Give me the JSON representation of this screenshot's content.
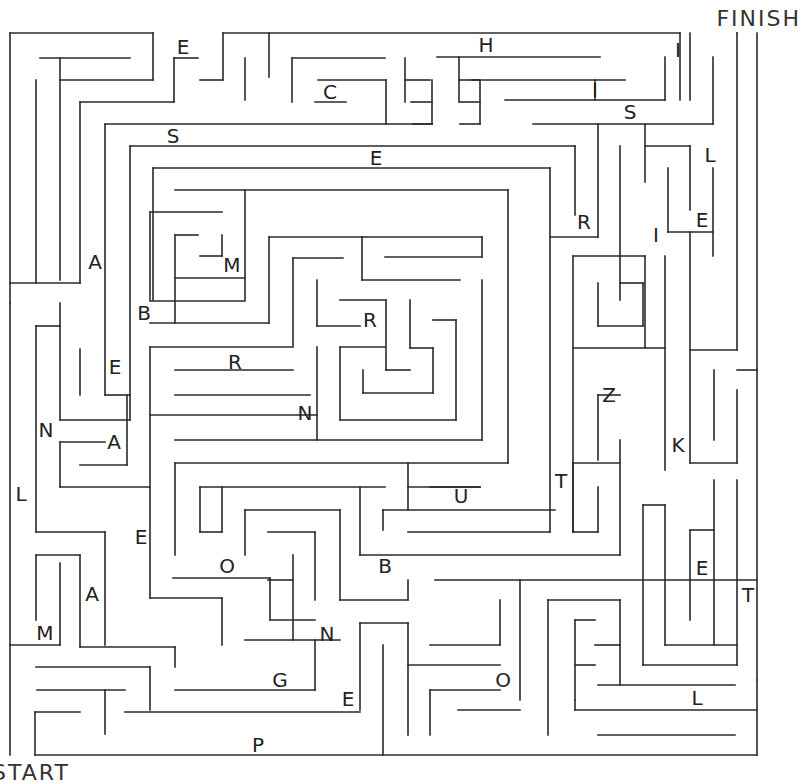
{
  "puzzle": {
    "type": "letter-maze",
    "finish_label": "FINISH",
    "start_label": "START",
    "wall_color": "#2a2a2a",
    "background": "#ffffff"
  },
  "letters": [
    {
      "ch": "E",
      "x": 183,
      "y": 47
    },
    {
      "ch": "H",
      "x": 486,
      "y": 45
    },
    {
      "ch": "I",
      "x": 678,
      "y": 50
    },
    {
      "ch": "C",
      "x": 330,
      "y": 92
    },
    {
      "ch": "I",
      "x": 595,
      "y": 90
    },
    {
      "ch": "S",
      "x": 630,
      "y": 112
    },
    {
      "ch": "S",
      "x": 173,
      "y": 136
    },
    {
      "ch": "E",
      "x": 376,
      "y": 158
    },
    {
      "ch": "L",
      "x": 710,
      "y": 155
    },
    {
      "ch": "R",
      "x": 584,
      "y": 222
    },
    {
      "ch": "E",
      "x": 702,
      "y": 220
    },
    {
      "ch": "I",
      "x": 656,
      "y": 235
    },
    {
      "ch": "A",
      "x": 95,
      "y": 262
    },
    {
      "ch": "M",
      "x": 232,
      "y": 265
    },
    {
      "ch": "B",
      "x": 144,
      "y": 313
    },
    {
      "ch": "R",
      "x": 370,
      "y": 320
    },
    {
      "ch": "R",
      "x": 235,
      "y": 362
    },
    {
      "ch": "E",
      "x": 115,
      "y": 367
    },
    {
      "ch": "Z",
      "x": 609,
      "y": 395
    },
    {
      "ch": "N",
      "x": 305,
      "y": 413
    },
    {
      "ch": "N",
      "x": 46,
      "y": 430
    },
    {
      "ch": "A",
      "x": 114,
      "y": 442
    },
    {
      "ch": "K",
      "x": 678,
      "y": 445
    },
    {
      "ch": "T",
      "x": 561,
      "y": 481
    },
    {
      "ch": "L",
      "x": 21,
      "y": 494
    },
    {
      "ch": "U",
      "x": 461,
      "y": 496
    },
    {
      "ch": "E",
      "x": 141,
      "y": 537
    },
    {
      "ch": "O",
      "x": 227,
      "y": 566
    },
    {
      "ch": "B",
      "x": 385,
      "y": 566
    },
    {
      "ch": "E",
      "x": 702,
      "y": 568
    },
    {
      "ch": "A",
      "x": 92,
      "y": 594
    },
    {
      "ch": "T",
      "x": 748,
      "y": 595
    },
    {
      "ch": "M",
      "x": 45,
      "y": 633
    },
    {
      "ch": "N",
      "x": 327,
      "y": 634
    },
    {
      "ch": "G",
      "x": 280,
      "y": 680
    },
    {
      "ch": "O",
      "x": 503,
      "y": 680
    },
    {
      "ch": "E",
      "x": 348,
      "y": 699
    },
    {
      "ch": "L",
      "x": 697,
      "y": 698
    },
    {
      "ch": "P",
      "x": 258,
      "y": 745
    }
  ],
  "walls": [
    [
      10,
      33,
      10,
      303
    ],
    [
      10,
      33,
      153,
      33
    ],
    [
      153,
      33,
      153,
      80
    ],
    [
      223,
      33,
      680,
      33
    ],
    [
      680,
      33,
      680,
      100
    ],
    [
      737,
      33,
      737,
      33
    ],
    [
      40,
      58,
      130,
      58
    ],
    [
      60,
      58,
      60,
      280
    ],
    [
      36,
      80,
      36,
      283
    ],
    [
      60,
      80,
      153,
      80
    ],
    [
      80,
      102,
      174,
      102
    ],
    [
      80,
      102,
      80,
      283
    ],
    [
      10,
      283,
      80,
      283
    ],
    [
      10,
      303,
      10,
      755
    ],
    [
      174,
      58,
      174,
      102
    ],
    [
      174,
      58,
      198,
      58
    ],
    [
      223,
      33,
      223,
      80
    ],
    [
      200,
      80,
      223,
      80
    ],
    [
      245,
      58,
      245,
      100
    ],
    [
      269,
      33,
      269,
      77
    ],
    [
      292,
      58,
      385,
      58
    ],
    [
      292,
      58,
      292,
      102
    ],
    [
      318,
      80,
      386,
      80
    ],
    [
      386,
      80,
      386,
      124
    ],
    [
      315,
      102,
      346,
      102
    ],
    [
      405,
      58,
      405,
      102
    ],
    [
      405,
      80,
      430,
      80
    ],
    [
      411,
      102,
      432,
      102
    ],
    [
      432,
      80,
      432,
      124
    ],
    [
      413,
      124,
      432,
      124
    ],
    [
      437,
      57,
      600,
      57
    ],
    [
      459,
      57,
      459,
      102
    ],
    [
      459,
      80,
      480,
      80
    ],
    [
      480,
      80,
      472,
      80
    ],
    [
      482,
      80,
      625,
      80
    ],
    [
      460,
      102,
      480,
      102
    ],
    [
      480,
      80,
      480,
      124
    ],
    [
      460,
      124,
      480,
      124
    ],
    [
      505,
      100,
      665,
      100
    ],
    [
      595,
      80,
      595,
      100
    ],
    [
      665,
      57,
      665,
      100
    ],
    [
      690,
      33,
      690,
      100
    ],
    [
      533,
      124,
      713,
      124
    ],
    [
      713,
      57,
      713,
      124
    ],
    [
      105,
      124,
      432,
      124
    ],
    [
      105,
      124,
      105,
      395
    ],
    [
      130,
      146,
      575,
      146
    ],
    [
      130,
      146,
      130,
      420
    ],
    [
      153,
      168,
      550,
      168
    ],
    [
      153,
      168,
      153,
      300
    ],
    [
      575,
      146,
      575,
      215
    ],
    [
      598,
      124,
      598,
      237
    ],
    [
      550,
      237,
      598,
      237
    ],
    [
      550,
      168,
      550,
      532
    ],
    [
      645,
      124,
      645,
      182
    ],
    [
      645,
      146,
      690,
      146
    ],
    [
      690,
      146,
      690,
      210
    ],
    [
      668,
      168,
      668,
      232
    ],
    [
      668,
      232,
      713,
      232
    ],
    [
      713,
      168,
      713,
      256
    ],
    [
      620,
      146,
      620,
      300
    ],
    [
      620,
      283,
      643,
      283
    ],
    [
      643,
      283,
      643,
      326
    ],
    [
      598,
      283,
      598,
      326
    ],
    [
      598,
      326,
      643,
      326
    ],
    [
      573,
      256,
      645,
      256
    ],
    [
      573,
      256,
      573,
      532
    ],
    [
      645,
      256,
      645,
      348
    ],
    [
      573,
      348,
      665,
      348
    ],
    [
      665,
      256,
      665,
      470
    ],
    [
      690,
      232,
      690,
      463
    ],
    [
      690,
      350,
      737,
      350
    ],
    [
      737,
      33,
      737,
      350
    ],
    [
      757,
      33,
      757,
      680
    ],
    [
      737,
      370,
      757,
      370
    ],
    [
      714,
      370,
      714,
      440
    ],
    [
      737,
      390,
      737,
      463
    ],
    [
      690,
      463,
      737,
      463
    ],
    [
      175,
      190,
      508,
      190
    ],
    [
      508,
      190,
      508,
      463
    ],
    [
      245,
      190,
      245,
      300
    ],
    [
      150,
      212,
      222,
      212
    ],
    [
      150,
      212,
      150,
      300
    ],
    [
      175,
      235,
      198,
      235
    ],
    [
      175,
      235,
      175,
      323
    ],
    [
      200,
      256,
      222,
      256
    ],
    [
      222,
      235,
      222,
      256
    ],
    [
      175,
      278,
      245,
      278
    ],
    [
      150,
      301,
      245,
      301
    ],
    [
      269,
      237,
      362,
      237
    ],
    [
      362,
      237,
      482,
      237
    ],
    [
      482,
      237,
      482,
      257
    ],
    [
      385,
      257,
      482,
      257
    ],
    [
      362,
      237,
      362,
      280
    ],
    [
      362,
      280,
      460,
      280
    ],
    [
      293,
      258,
      343,
      258
    ],
    [
      293,
      258,
      293,
      346
    ],
    [
      150,
      323,
      269,
      323
    ],
    [
      269,
      237,
      269,
      323
    ],
    [
      317,
      280,
      317,
      326
    ],
    [
      317,
      326,
      360,
      326
    ],
    [
      340,
      300,
      386,
      300
    ],
    [
      386,
      300,
      386,
      370
    ],
    [
      386,
      370,
      410,
      370
    ],
    [
      410,
      300,
      410,
      348
    ],
    [
      410,
      348,
      433,
      348
    ],
    [
      433,
      348,
      433,
      393
    ],
    [
      363,
      393,
      433,
      393
    ],
    [
      363,
      370,
      363,
      393
    ],
    [
      433,
      320,
      456,
      320
    ],
    [
      456,
      320,
      456,
      420
    ],
    [
      340,
      420,
      456,
      420
    ],
    [
      340,
      347,
      340,
      420
    ],
    [
      340,
      347,
      385,
      347
    ],
    [
      482,
      280,
      482,
      440
    ],
    [
      175,
      440,
      482,
      440
    ],
    [
      317,
      347,
      317,
      440
    ],
    [
      150,
      347,
      293,
      347
    ],
    [
      150,
      347,
      150,
      598
    ],
    [
      175,
      370,
      293,
      370
    ],
    [
      175,
      395,
      310,
      395
    ],
    [
      150,
      415,
      317,
      415
    ],
    [
      105,
      395,
      130,
      395
    ],
    [
      60,
      303,
      60,
      420
    ],
    [
      60,
      420,
      130,
      420
    ],
    [
      36,
      326,
      36,
      532
    ],
    [
      36,
      326,
      60,
      326
    ],
    [
      80,
      349,
      80,
      395
    ],
    [
      60,
      442,
      105,
      442
    ],
    [
      60,
      442,
      60,
      487
    ],
    [
      60,
      487,
      150,
      487
    ],
    [
      80,
      465,
      127,
      465
    ],
    [
      127,
      395,
      127,
      465
    ],
    [
      175,
      463,
      508,
      463
    ],
    [
      175,
      463,
      175,
      555
    ],
    [
      200,
      487,
      385,
      487
    ],
    [
      200,
      487,
      200,
      532
    ],
    [
      200,
      532,
      222,
      532
    ],
    [
      222,
      487,
      222,
      532
    ],
    [
      408,
      463,
      408,
      510
    ],
    [
      383,
      510,
      383,
      530
    ],
    [
      383,
      510,
      555,
      510
    ],
    [
      408,
      487,
      480,
      487
    ],
    [
      430,
      487,
      480,
      487
    ],
    [
      408,
      532,
      550,
      532
    ],
    [
      360,
      487,
      360,
      555
    ],
    [
      360,
      555,
      620,
      555
    ],
    [
      620,
      440,
      620,
      555
    ],
    [
      598,
      395,
      598,
      460
    ],
    [
      598,
      395,
      620,
      395
    ],
    [
      573,
      463,
      620,
      463
    ],
    [
      573,
      463,
      573,
      532
    ],
    [
      573,
      532,
      598,
      532
    ],
    [
      598,
      487,
      598,
      532
    ],
    [
      245,
      510,
      340,
      510
    ],
    [
      245,
      510,
      245,
      555
    ],
    [
      268,
      532,
      315,
      532
    ],
    [
      315,
      532,
      315,
      600
    ],
    [
      293,
      555,
      293,
      640
    ],
    [
      268,
      580,
      293,
      580
    ],
    [
      173,
      578,
      270,
      578
    ],
    [
      270,
      578,
      270,
      620
    ],
    [
      270,
      620,
      315,
      620
    ],
    [
      340,
      510,
      340,
      600
    ],
    [
      36,
      532,
      105,
      532
    ],
    [
      105,
      532,
      105,
      645
    ],
    [
      36,
      555,
      80,
      555
    ],
    [
      36,
      555,
      36,
      620
    ],
    [
      60,
      563,
      60,
      645
    ],
    [
      10,
      645,
      60,
      645
    ],
    [
      80,
      555,
      80,
      647
    ],
    [
      150,
      598,
      222,
      598
    ],
    [
      222,
      598,
      222,
      645
    ],
    [
      80,
      647,
      175,
      647
    ],
    [
      175,
      647,
      175,
      667
    ],
    [
      36,
      667,
      150,
      667
    ],
    [
      150,
      667,
      150,
      710
    ],
    [
      37,
      690,
      125,
      690
    ],
    [
      105,
      690,
      105,
      734
    ],
    [
      35,
      712,
      80,
      712
    ],
    [
      35,
      712,
      35,
      755
    ],
    [
      175,
      690,
      315,
      690
    ],
    [
      315,
      690,
      315,
      640
    ],
    [
      245,
      640,
      340,
      640
    ],
    [
      340,
      600,
      408,
      600
    ],
    [
      408,
      580,
      408,
      600
    ],
    [
      435,
      580,
      757,
      580
    ],
    [
      520,
      580,
      520,
      700
    ],
    [
      360,
      623,
      360,
      710
    ],
    [
      360,
      623,
      408,
      623
    ],
    [
      408,
      623,
      408,
      735
    ],
    [
      125,
      712,
      360,
      712
    ],
    [
      383,
      645,
      383,
      755
    ],
    [
      408,
      665,
      500,
      665
    ],
    [
      500,
      600,
      500,
      645
    ],
    [
      430,
      645,
      500,
      645
    ],
    [
      430,
      690,
      430,
      735
    ],
    [
      430,
      690,
      500,
      690
    ],
    [
      458,
      710,
      520,
      710
    ],
    [
      548,
      600,
      548,
      735
    ],
    [
      548,
      600,
      620,
      600
    ],
    [
      575,
      620,
      575,
      700
    ],
    [
      575,
      620,
      595,
      620
    ],
    [
      595,
      645,
      620,
      645
    ],
    [
      575,
      665,
      595,
      665
    ],
    [
      620,
      600,
      620,
      685
    ],
    [
      598,
      685,
      735,
      685
    ],
    [
      643,
      505,
      643,
      665
    ],
    [
      643,
      505,
      665,
      505
    ],
    [
      665,
      505,
      665,
      645
    ],
    [
      690,
      530,
      690,
      620
    ],
    [
      690,
      530,
      714,
      530
    ],
    [
      714,
      480,
      714,
      645
    ],
    [
      665,
      645,
      737,
      645
    ],
    [
      737,
      480,
      737,
      665
    ],
    [
      643,
      665,
      737,
      665
    ],
    [
      575,
      710,
      757,
      710
    ],
    [
      575,
      700,
      575,
      710
    ],
    [
      598,
      735,
      735,
      735
    ],
    [
      35,
      755,
      757,
      755
    ],
    [
      757,
      680,
      757,
      755
    ]
  ]
}
